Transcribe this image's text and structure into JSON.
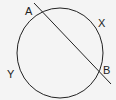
{
  "diagram": {
    "type": "circle-with-secant",
    "background": "#f4f4f4",
    "stroke_color": "#222222",
    "circle": {
      "cx": 60,
      "cy": 53,
      "rx": 43,
      "ry": 45
    },
    "secant": {
      "x1": 34,
      "y1": 3,
      "x2": 111,
      "y2": 84
    },
    "labels": {
      "A": {
        "text": "A",
        "x": 25,
        "y": 15
      },
      "B": {
        "text": "B",
        "x": 103,
        "y": 74
      },
      "X": {
        "text": "X",
        "x": 98,
        "y": 27
      },
      "Y": {
        "text": "Y",
        "x": 7,
        "y": 78
      }
    }
  }
}
